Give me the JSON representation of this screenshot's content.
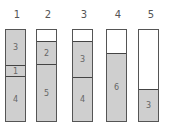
{
  "columns": [
    {
      "label": "1",
      "segments": [
        {
          "value": "3",
          "filled": true
        },
        {
          "value": "1",
          "filled": true
        },
        {
          "value": "4",
          "filled": true
        }
      ]
    },
    {
      "label": "2",
      "segments": [
        {
          "value": "",
          "filled": false
        },
        {
          "value": "2",
          "filled": true
        },
        {
          "value": "5",
          "filled": true
        }
      ]
    },
    {
      "label": "3",
      "segments": [
        {
          "value": "",
          "filled": false
        },
        {
          "value": "3",
          "filled": true
        },
        {
          "value": "4",
          "filled": true
        }
      ]
    },
    {
      "label": "4",
      "segments": [
        {
          "value": "",
          "filled": false
        },
        {
          "value": "6",
          "filled": true
        }
      ]
    },
    {
      "label": "5",
      "segments": [
        {
          "value": "",
          "filled": false
        },
        {
          "value": "3",
          "filled": true
        }
      ]
    }
  ],
  "colors": {
    "fill": "#cfcfcf",
    "border": "#555555",
    "empty": "#ffffff"
  }
}
